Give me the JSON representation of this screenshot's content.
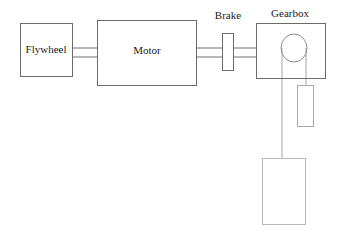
{
  "diagram": {
    "components": [
      {
        "id": "flywheel",
        "label": "Flywheel",
        "shape": "rectangle",
        "x": 20,
        "y": 23,
        "w": 52,
        "h": 53,
        "label_x": 46,
        "label_y": 50
      },
      {
        "id": "motor",
        "label": "Motor",
        "shape": "rectangle",
        "x": 97,
        "y": 20,
        "w": 99,
        "h": 65,
        "label_x": 147,
        "label_y": 51
      },
      {
        "id": "brake",
        "label": "Brake",
        "shape": "rectangle",
        "x": 222,
        "y": 33,
        "w": 11,
        "h": 37,
        "label_x": 228,
        "label_y": 16
      },
      {
        "id": "gearbox",
        "label": "Gearbox",
        "shape": "rectangle",
        "x": 256,
        "y": 23,
        "w": 69,
        "h": 55,
        "label_x": 290,
        "label_y": 14
      }
    ],
    "pulley": {
      "id": "gearbox-pulley",
      "cx": 294,
      "cy": 48,
      "rx": 13,
      "ry": 14
    },
    "shafts": [
      {
        "id": "flywheel-motor-shaft",
        "x1": 72,
        "x2": 97,
        "y_top": 48,
        "y_bottom": 57
      },
      {
        "id": "motor-brake-shaft",
        "x1": 196,
        "x2": 222,
        "y_top": 48,
        "y_bottom": 57
      },
      {
        "id": "brake-gearbox-shaft",
        "x1": 233,
        "x2": 256,
        "y_top": 48,
        "y_bottom": 57
      }
    ],
    "cables": [
      {
        "id": "left-cable",
        "x": 282,
        "y1": 48,
        "y2": 158
      },
      {
        "id": "right-cable",
        "x": 306,
        "y1": 48,
        "y2": 85
      }
    ],
    "weights": [
      {
        "id": "small-weight",
        "label": "",
        "x": 297,
        "y": 85,
        "w": 16,
        "h": 41
      },
      {
        "id": "large-weight",
        "label": "",
        "x": 262,
        "y": 158,
        "w": 43,
        "h": 66
      }
    ]
  },
  "colors": {
    "box_stroke": "#6b6b6b",
    "weight_stroke": "#b9b9b9",
    "shaft_stroke": "#6f6f6f",
    "cable_stroke": "#a5a5a5",
    "pulley_stroke": "#8f8f8f",
    "label_text": "#1a1a1a",
    "background": "#ffffff"
  }
}
